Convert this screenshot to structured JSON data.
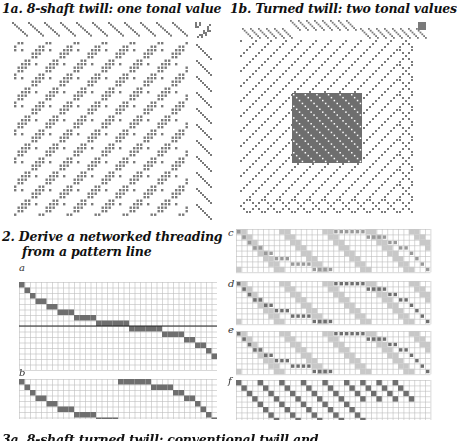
{
  "panels": {
    "p1a": {
      "title": "1a. 8-shaft twill: one tonal value"
    },
    "p1b": {
      "title": "1b. Turned twill: two tonal values"
    },
    "p2": {
      "title_line1": "2. Derive a networked threading",
      "title_line2": "from a pattern line"
    },
    "p2a": {
      "label": "a"
    },
    "p2b": {
      "label": "b"
    },
    "pc": {
      "label": "c"
    },
    "pd": {
      "label": "d"
    },
    "pe": {
      "label": "e"
    },
    "pf": {
      "label": "f"
    },
    "p3": {
      "title": "3a. 8-shaft turned twill: conventional twill and"
    }
  },
  "colors": {
    "ink": "#7a7a7a",
    "dark": "#6e6e6e",
    "light": "#c8c8c8",
    "grid": "#bdbdbd",
    "bg": "#ffffff"
  },
  "grids": {
    "threading_cols": 36,
    "threading_rows": 8,
    "pattern_line_a": [
      0,
      1,
      2,
      3,
      3,
      4,
      4,
      5,
      5,
      5,
      6,
      6,
      6,
      6,
      7,
      7,
      7,
      7,
      7,
      7,
      8,
      8,
      8,
      8,
      8,
      8,
      9,
      9,
      9,
      9,
      10,
      10,
      11,
      11,
      12,
      13
    ],
    "pattern_b_block1": [
      0,
      1,
      2,
      3,
      3,
      4,
      4,
      5,
      5,
      5,
      6,
      6,
      6,
      6,
      7,
      7,
      7,
      7
    ],
    "pattern_b_block2": [
      0,
      0,
      0,
      0,
      0,
      0,
      1,
      1,
      1,
      1,
      2,
      2,
      3,
      3,
      4,
      5,
      6,
      7
    ]
  }
}
